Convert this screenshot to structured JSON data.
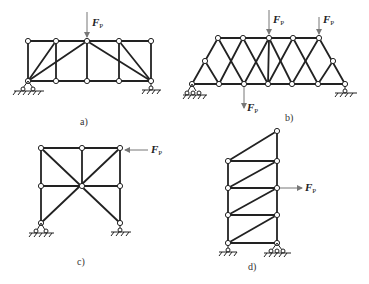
{
  "figure": {
    "panels": [
      {
        "id": "a",
        "label": "a)",
        "type": "truss",
        "loads": [
          {
            "symbol": "F",
            "subscript": "P",
            "direction": "down"
          }
        ],
        "supports": [
          "pin-left",
          "roller-right"
        ]
      },
      {
        "id": "b",
        "label": "b)",
        "type": "truss",
        "loads": [
          {
            "symbol": "F",
            "subscript": "P",
            "direction": "down"
          },
          {
            "symbol": "F",
            "subscript": "P",
            "direction": "down"
          },
          {
            "symbol": "F",
            "subscript": "P",
            "direction": "down"
          }
        ],
        "supports": [
          "pin-left",
          "roller-right"
        ]
      },
      {
        "id": "c",
        "label": "c)",
        "type": "truss",
        "loads": [
          {
            "symbol": "F",
            "subscript": "P",
            "direction": "left"
          }
        ],
        "supports": [
          "pin-left",
          "roller-right"
        ]
      },
      {
        "id": "d",
        "label": "d)",
        "type": "truss",
        "loads": [
          {
            "symbol": "F",
            "subscript": "P",
            "direction": "right"
          }
        ],
        "supports": [
          "roller-left",
          "pin-right"
        ]
      }
    ]
  }
}
